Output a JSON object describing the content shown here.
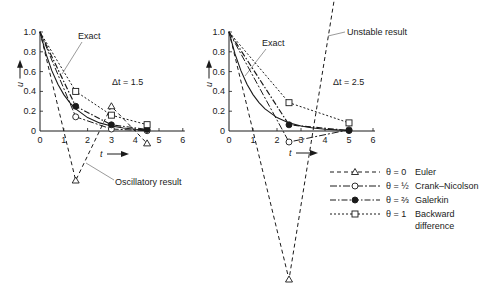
{
  "chart_data": [
    {
      "type": "line",
      "title": "",
      "annotation_dt": "Δt = 1.5",
      "xlabel": "t",
      "ylabel": "u",
      "xlim": [
        0,
        6
      ],
      "ylim": [
        0,
        1.0
      ],
      "xticks": [
        "0",
        "1",
        "2",
        "3",
        "4",
        "5",
        "6"
      ],
      "yticks": [
        "0",
        "0.2",
        "0.4",
        "0.6",
        "0.8",
        "1.0"
      ],
      "grid": false,
      "annotations": [
        "Exact",
        "Oscillatory result"
      ],
      "series": [
        {
          "name": "Exact",
          "x": [
            0,
            0.25,
            0.5,
            0.75,
            1,
            1.25,
            1.5,
            2,
            2.5,
            3,
            3.5,
            4,
            4.5
          ],
          "values": [
            1,
            0.779,
            0.607,
            0.472,
            0.368,
            0.287,
            0.223,
            0.135,
            0.082,
            0.05,
            0.03,
            0.018,
            0.011
          ]
        },
        {
          "name": "θ = 0 Euler",
          "x": [
            0,
            1.5,
            3,
            4.5
          ],
          "values": [
            1,
            -0.5,
            0.25,
            -0.125
          ]
        },
        {
          "name": "θ = 1/2 Crank–Nicolson",
          "x": [
            0,
            1.5,
            3,
            4.5
          ],
          "values": [
            1,
            0.143,
            0.02,
            0.003
          ]
        },
        {
          "name": "θ = 2/3 Galerkin",
          "x": [
            0,
            1.5,
            3,
            4.5
          ],
          "values": [
            1,
            0.25,
            0.0625,
            0.016
          ]
        },
        {
          "name": "θ = 1 Backward difference",
          "x": [
            0,
            1.5,
            3,
            4.5
          ],
          "values": [
            1,
            0.4,
            0.16,
            0.064
          ]
        }
      ]
    },
    {
      "type": "line",
      "title": "",
      "annotation_dt": "Δt = 2.5",
      "xlabel": "t",
      "ylabel": "u",
      "xlim": [
        0,
        6
      ],
      "ylim": [
        0,
        1.0
      ],
      "xticks": [
        "0",
        "1",
        "2",
        "3",
        "4",
        "5",
        "6"
      ],
      "yticks": [
        "0",
        "0.2",
        "0.4",
        "0.6",
        "0.8",
        "1.0"
      ],
      "grid": false,
      "annotations": [
        "Exact",
        "Unstable result"
      ],
      "series": [
        {
          "name": "Exact",
          "x": [
            0,
            0.25,
            0.5,
            0.75,
            1,
            1.25,
            1.5,
            2,
            2.5,
            3,
            3.5,
            4,
            4.5,
            5
          ],
          "values": [
            1,
            0.779,
            0.607,
            0.472,
            0.368,
            0.287,
            0.223,
            0.135,
            0.082,
            0.05,
            0.03,
            0.018,
            0.011,
            0.007
          ]
        },
        {
          "name": "θ = 0 Euler",
          "x": [
            0,
            2.5,
            5
          ],
          "values": [
            1,
            -1.5,
            2.25
          ]
        },
        {
          "name": "θ = 1/2 Crank–Nicolson",
          "x": [
            0,
            2.5,
            5
          ],
          "values": [
            1,
            -0.111,
            0.012
          ]
        },
        {
          "name": "θ = 2/3 Galerkin",
          "x": [
            0,
            2.5,
            5
          ],
          "values": [
            1,
            0.0625,
            0.004
          ]
        },
        {
          "name": "θ = 1 Backward difference",
          "x": [
            0,
            2.5,
            5
          ],
          "values": [
            1,
            0.286,
            0.082
          ]
        }
      ]
    }
  ],
  "legend": {
    "items": [
      {
        "label_theta": "θ = 0",
        "label_name": "Euler",
        "marker": "triangle"
      },
      {
        "label_theta": "θ = ½",
        "label_name": "Crank–Nicolson",
        "marker": "open-circle"
      },
      {
        "label_theta": "θ = ⅔",
        "label_name": "Galerkin",
        "marker": "filled-circle"
      },
      {
        "label_theta": "θ = 1",
        "label_name": "Backward",
        "label_name2": "difference",
        "marker": "square"
      }
    ]
  },
  "labels": {
    "exact": "Exact",
    "oscillatory": "Oscillatory result",
    "unstable": "Unstable result",
    "dt_left": "Δt = 1.5",
    "dt_right": "Δt = 2.5",
    "u": "u",
    "t": "t"
  }
}
